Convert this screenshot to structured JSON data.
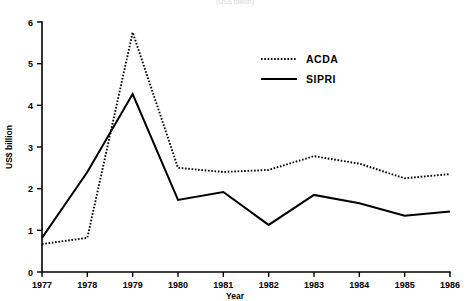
{
  "chart_data": {
    "type": "line",
    "title": "",
    "caption": "(US$ billion)",
    "xlabel": "Year",
    "ylabel": "US$ billion",
    "x": [
      1977,
      1978,
      1979,
      1980,
      1981,
      1982,
      1983,
      1984,
      1985,
      1986
    ],
    "categories": [
      "1977",
      "1978",
      "1979",
      "1980",
      "1981",
      "1982",
      "1983",
      "1984",
      "1985",
      "1986"
    ],
    "xlim": [
      1977,
      1986
    ],
    "ylim": [
      0,
      6
    ],
    "yticks": [
      0,
      1,
      2,
      3,
      4,
      5,
      6
    ],
    "ytick_labels": [
      "0",
      "1",
      "2",
      "3",
      "4",
      "5",
      "6"
    ],
    "grid": false,
    "legend_position": "upper right",
    "series": [
      {
        "name": "ACDA",
        "style": "dotted",
        "color": "#000000",
        "values": [
          0.67,
          0.82,
          5.75,
          2.5,
          2.4,
          2.45,
          2.78,
          2.6,
          2.25,
          2.35
        ]
      },
      {
        "name": "SIPRI",
        "style": "solid",
        "color": "#000000",
        "values": [
          0.82,
          2.4,
          4.27,
          1.73,
          1.92,
          1.13,
          1.85,
          1.65,
          1.35,
          1.45
        ]
      }
    ]
  },
  "legend": {
    "entries": [
      {
        "label": "ACDA",
        "style": "dotted"
      },
      {
        "label": "SIPRI",
        "style": "solid"
      }
    ]
  }
}
